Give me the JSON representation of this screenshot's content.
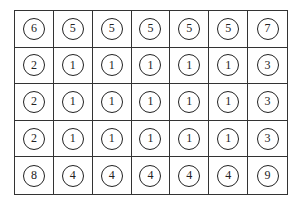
{
  "grid": {
    "rows": 5,
    "cols": 7,
    "values": [
      [
        "6",
        "5",
        "5",
        "5",
        "5",
        "5",
        "7"
      ],
      [
        "2",
        "1",
        "1",
        "1",
        "1",
        "1",
        "3"
      ],
      [
        "2",
        "1",
        "1",
        "1",
        "1",
        "1",
        "3"
      ],
      [
        "2",
        "1",
        "1",
        "1",
        "1",
        "1",
        "3"
      ],
      [
        "8",
        "4",
        "4",
        "4",
        "4",
        "4",
        "9"
      ]
    ]
  }
}
